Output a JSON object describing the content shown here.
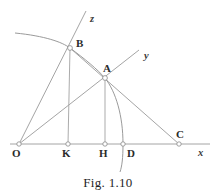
{
  "figure": {
    "caption": "Fig. 1.10",
    "background_color": "#ffffff",
    "line_color": "#9a9a9a",
    "arc_color": "#8e8e8e",
    "label_color": "#2b2b2b",
    "marker_fill": "#ffffff",
    "marker_stroke": "#8a8a8a"
  },
  "points": [
    {
      "id": "O",
      "label": "O",
      "x": 19,
      "y": 144,
      "label_x": 12,
      "label_y": 148,
      "marker": true
    },
    {
      "id": "K",
      "label": "K",
      "x": 68,
      "y": 144,
      "label_x": 62,
      "label_y": 148,
      "marker": true
    },
    {
      "id": "H",
      "label": "H",
      "x": 105,
      "y": 144,
      "label_x": 99,
      "label_y": 148,
      "marker": true
    },
    {
      "id": "D",
      "label": "D",
      "x": 123,
      "y": 144,
      "label_x": 127,
      "label_y": 148,
      "marker": true
    },
    {
      "id": "C",
      "label": "C",
      "x": 179,
      "y": 144,
      "label_x": 176,
      "label_y": 129,
      "marker": true
    },
    {
      "id": "A",
      "label": "A",
      "x": 105,
      "y": 78,
      "label_x": 103,
      "label_y": 63,
      "marker": true
    },
    {
      "id": "B",
      "label": "B",
      "x": 70,
      "y": 48,
      "label_x": 76,
      "label_y": 38,
      "marker": true
    }
  ],
  "axes": [
    {
      "id": "x",
      "label": "x",
      "label_x": 198,
      "label_y": 148,
      "from_x": 10,
      "from_y": 144,
      "to_x": 210,
      "to_y": 144
    },
    {
      "id": "y",
      "label": "y",
      "label_x": 144,
      "label_y": 51,
      "from_x": 19,
      "from_y": 144,
      "to_x": 139,
      "to_y": 50
    },
    {
      "id": "z",
      "label": "z",
      "label_x": 90,
      "label_y": 14,
      "from_x": 19,
      "from_y": 144,
      "to_x": 86,
      "to_y": 11
    }
  ],
  "segments": [
    {
      "id": "ray-oz",
      "name": "ray-O-to-z",
      "x1": 19,
      "y1": 144,
      "x2": 86,
      "y2": 11
    },
    {
      "id": "ray-oy",
      "name": "ray-O-to-y",
      "x1": 19,
      "y1": 144,
      "x2": 139,
      "y2": 50
    },
    {
      "id": "axis-ox",
      "name": "axis-O-to-x",
      "x1": 10,
      "y1": 144,
      "x2": 210,
      "y2": 144
    },
    {
      "id": "line-bc",
      "name": "line-B-through-A-to-C",
      "x1": 70,
      "y1": 48,
      "x2": 179,
      "y2": 144
    },
    {
      "id": "perp-bk",
      "name": "perpendicular-B-to-K",
      "x1": 70,
      "y1": 48,
      "x2": 68,
      "y2": 144
    },
    {
      "id": "perp-ah",
      "name": "perpendicular-A-to-H",
      "x1": 105,
      "y1": 78,
      "x2": 105,
      "y2": 144
    }
  ],
  "arcs": [
    {
      "id": "arc-main",
      "name": "circular-arc-through-B-A-D",
      "path": "M 15 33 C 45 36 62 42 70 48 C 85 59 97 69 105 78 C 116 92 123 116 123 144 C 123 158 122 166 120 172"
    }
  ]
}
